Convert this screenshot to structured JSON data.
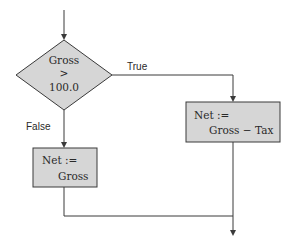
{
  "diagram": {
    "type": "flowchart",
    "decision": {
      "line1": "Gross",
      "line2": ">",
      "line3": "100.0"
    },
    "branches": {
      "true_label": "True",
      "false_label": "False"
    },
    "process_true": {
      "line1": "Net :=",
      "line2": "Gross − Tax"
    },
    "process_false": {
      "line1": "Net :=",
      "line2": "Gross"
    },
    "colors": {
      "shape_fill": "#d6d6d6",
      "stroke": "#3a3a3a",
      "text": "#2a2a2a",
      "background": "#ffffff"
    }
  }
}
